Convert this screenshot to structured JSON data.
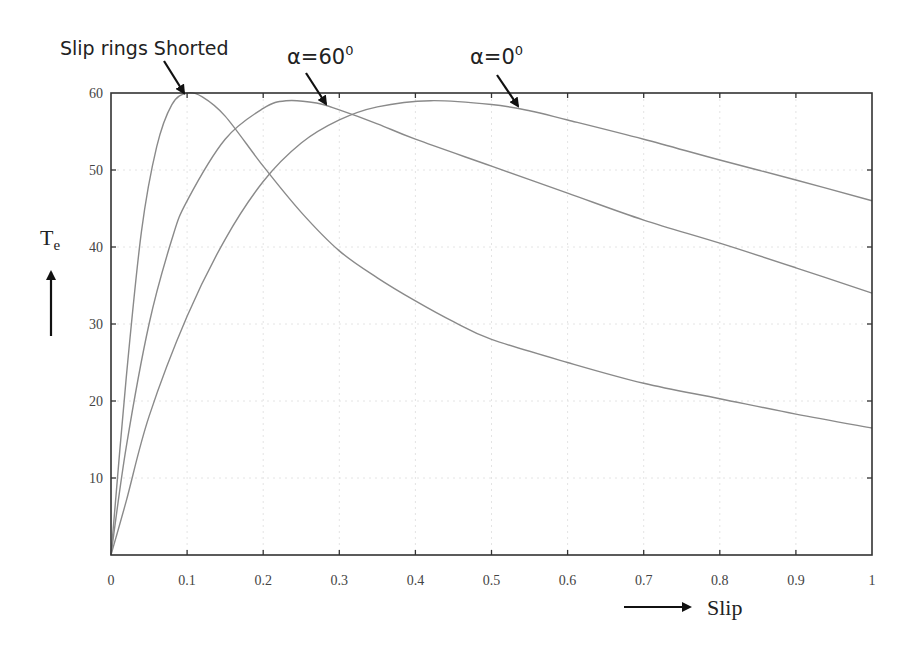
{
  "chart_data": {
    "type": "line",
    "title": "",
    "xlabel": "Slip",
    "ylabel": "Te",
    "ylabel_main": "T",
    "ylabel_sub": "e",
    "xlim": [
      0,
      1
    ],
    "ylim": [
      0,
      60
    ],
    "grid": true,
    "legend": "none (curves labelled by arrow annotations)",
    "x_ticks": [
      "0",
      "0.1",
      "0.2",
      "0.3",
      "0.4",
      "0.5",
      "0.6",
      "0.7",
      "0.8",
      "0.9",
      "1"
    ],
    "y_ticks": [
      "10",
      "20",
      "30",
      "40",
      "50",
      "60"
    ],
    "series": [
      {
        "name": "Slip rings Shorted",
        "x": [
          0,
          0.02,
          0.04,
          0.06,
          0.08,
          0.1,
          0.12,
          0.15,
          0.2,
          0.25,
          0.3,
          0.35,
          0.4,
          0.45,
          0.5,
          0.6,
          0.7,
          0.8,
          0.9,
          1.0
        ],
        "values": [
          0,
          23,
          42,
          53,
          58.5,
          60,
          59.5,
          57,
          50.5,
          44.5,
          39.5,
          36,
          33,
          30.3,
          28,
          25,
          22.3,
          20.3,
          18.3,
          16.5
        ]
      },
      {
        "name": "α=60°",
        "x": [
          0,
          0.02,
          0.05,
          0.08,
          0.1,
          0.15,
          0.2,
          0.23,
          0.27,
          0.3,
          0.35,
          0.4,
          0.5,
          0.6,
          0.7,
          0.8,
          0.9,
          1.0
        ],
        "values": [
          0,
          14,
          30,
          41,
          46,
          54,
          58,
          59,
          58.7,
          57.8,
          56,
          54,
          50.5,
          47,
          43.5,
          40.5,
          37.3,
          34
        ]
      },
      {
        "name": "α=0°",
        "x": [
          0,
          0.02,
          0.05,
          0.1,
          0.15,
          0.2,
          0.25,
          0.3,
          0.35,
          0.42,
          0.5,
          0.55,
          0.6,
          0.7,
          0.8,
          0.9,
          1.0
        ],
        "values": [
          0,
          7,
          18,
          31,
          41,
          48.5,
          53.5,
          56.5,
          58.2,
          59,
          58.5,
          57.7,
          56.5,
          54,
          51.3,
          48.7,
          46
        ]
      }
    ],
    "annotations": [
      {
        "text": "Slip rings Shorted",
        "points_to": {
          "x": 0.1,
          "y": 60
        }
      },
      {
        "text": "α=60⁰",
        "points_to": {
          "x": 0.28,
          "y": 58.5
        }
      },
      {
        "text": "α=0⁰",
        "points_to": {
          "x": 0.55,
          "y": 58
        }
      }
    ]
  },
  "labels": {
    "annotation_shorted": "Slip rings Shorted",
    "annotation_alpha60_base": "α=60",
    "annotation_alpha60_sup": "0",
    "annotation_alpha0_base": "α=0",
    "annotation_alpha0_sup": "0",
    "x_axis_title": "Slip",
    "y_axis_title_main": "T",
    "y_axis_title_sub": "e"
  },
  "colors": {
    "curve": "#8a8a8a",
    "frame": "#333333",
    "grid": "#e4e4e4",
    "arrow": "#111111"
  }
}
